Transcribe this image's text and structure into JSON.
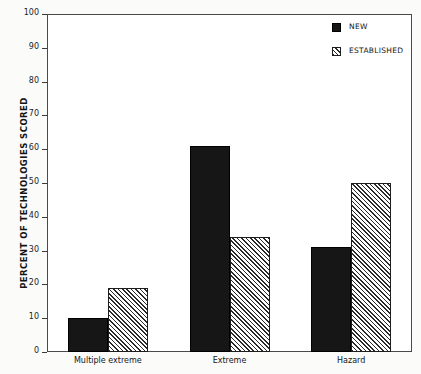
{
  "chart_data": {
    "type": "bar",
    "title": "",
    "xlabel": "",
    "ylabel": "PERCENT OF TECHNOLOGIES SCORED",
    "ylim": [
      0,
      100
    ],
    "ytick_step": 10,
    "yticks": [
      0,
      10,
      20,
      30,
      40,
      50,
      60,
      70,
      80,
      90,
      100
    ],
    "categories": [
      "Multiple extreme",
      "Extreme",
      "Hazard"
    ],
    "grid": false,
    "legend_position": "top-right",
    "series": [
      {
        "name": "NEW",
        "pattern": "solid",
        "color": "#161616",
        "values": [
          10,
          61,
          31
        ]
      },
      {
        "name": "ESTABLISHED",
        "pattern": "hatch",
        "color": "#2a2a2a",
        "values": [
          19,
          34,
          50
        ]
      }
    ]
  },
  "legend": {
    "items": [
      {
        "label": "NEW"
      },
      {
        "label": "ESTABLISHED"
      }
    ]
  }
}
